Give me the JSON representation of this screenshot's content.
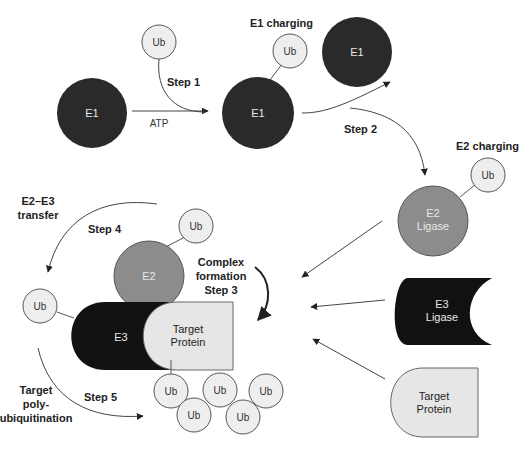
{
  "diagram": {
    "colors": {
      "e1": "#2a2a2a",
      "e2": "#8c8c8c",
      "e3": "#111111",
      "ub_fill": "#eeeeee",
      "target_fill": "#e6e6e6",
      "arrow": "#222222",
      "text_light": "#e8e8e8",
      "text_dark": "#222222"
    },
    "nodes": {
      "e1_start": "E1",
      "ub_free": "Ub",
      "atp": "ATP",
      "e1_charged": "E1",
      "ub_on_e1": "Ub",
      "e1_released": "E1",
      "e2_line1": "E2",
      "e2_line2": "Ligase",
      "ub_on_e2": "Ub",
      "e3_line1": "E3",
      "e3_line2": "Ligase",
      "target_line1": "Target",
      "target_line2": "Protein",
      "complex_e2": "E2",
      "complex_ub": "Ub",
      "complex_e3": "E3",
      "complex_target_line1": "Target",
      "complex_target_line2": "Protein",
      "ub_transferred": "Ub",
      "poly_ub": [
        "Ub",
        "Ub",
        "Ub",
        "Ub",
        "Ub"
      ]
    },
    "labels": {
      "step1": "Step 1",
      "e1_charging": "E1 charging",
      "step2": "Step 2",
      "e2_charging": "E2 charging",
      "e2e3_line1": "E2–E3",
      "e2e3_line2": "transfer",
      "step4": "Step 4",
      "complex_line1": "Complex",
      "complex_line2": "formation",
      "complex_line3": "Step 3",
      "target_poly_line1": "Target",
      "target_poly_line2": "poly-",
      "target_poly_line3": "ubiquitination",
      "step5": "Step 5"
    }
  }
}
